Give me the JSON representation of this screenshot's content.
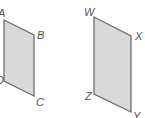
{
  "figure": {
    "colors": {
      "fill": "#d9d9d9",
      "stroke": "#6e6e6e",
      "label": "#555555"
    },
    "shapes": [
      {
        "name": "ABCD",
        "vertices": [
          {
            "label": "A",
            "x": 4,
            "y": 20,
            "lx": -2,
            "ly": 17
          },
          {
            "label": "B",
            "x": 34,
            "y": 35,
            "lx": 37,
            "ly": 39
          },
          {
            "label": "C",
            "x": 34,
            "y": 96,
            "lx": 36,
            "ly": 106
          },
          {
            "label": "D",
            "x": 4,
            "y": 81,
            "lx": -4,
            "ly": 84
          }
        ]
      },
      {
        "name": "WXYZ",
        "vertices": [
          {
            "label": "W",
            "x": 94,
            "y": 17,
            "lx": 84,
            "ly": 16
          },
          {
            "label": "X",
            "x": 131,
            "y": 36,
            "lx": 135,
            "ly": 40
          },
          {
            "label": "Y",
            "x": 131,
            "y": 112,
            "lx": 133,
            "ly": 120
          },
          {
            "label": "Z",
            "x": 94,
            "y": 94,
            "lx": 85,
            "ly": 100
          }
        ]
      }
    ]
  }
}
